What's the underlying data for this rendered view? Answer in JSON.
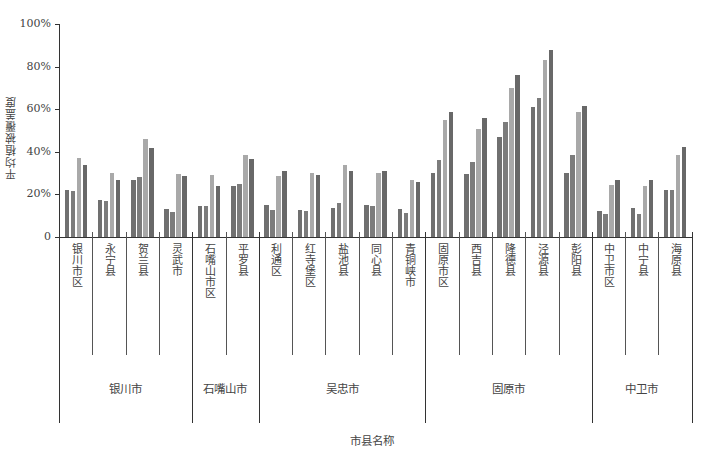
{
  "chart_data": {
    "type": "bar",
    "title": "",
    "xlabel": "市县名称",
    "ylabel": "平均植被覆盖度",
    "ylim": [
      0,
      100
    ],
    "yticks": [
      "0",
      "20%",
      "40%",
      "60%",
      "80%",
      "100%"
    ],
    "grid": false,
    "legend": null,
    "categories": [
      "银川市区",
      "永宁县",
      "贺兰县",
      "灵武市",
      "石嘴山市区",
      "平罗县",
      "利通区",
      "红寺堡区",
      "盐池县",
      "同心县",
      "青铜峡市",
      "固原市区",
      "西吉县",
      "隆德县",
      "泾源县",
      "彭阳县",
      "中卫市区",
      "中宁县",
      "海原县"
    ],
    "groups": [
      {
        "name": "银川市",
        "span": [
          0,
          3
        ]
      },
      {
        "name": "石嘴山市",
        "span": [
          4,
          5
        ]
      },
      {
        "name": "吴忠市",
        "span": [
          6,
          10
        ]
      },
      {
        "name": "固原市",
        "span": [
          11,
          15
        ]
      },
      {
        "name": "中卫市",
        "span": [
          16,
          18
        ]
      }
    ],
    "series": [
      {
        "name": "series-1",
        "color": "#707070",
        "values": [
          22,
          17.5,
          27,
          13,
          14.7,
          24.2,
          15.2,
          12.5,
          13.7,
          15,
          13.3,
          30,
          29.5,
          47,
          61,
          30.2,
          12.3,
          13.6,
          22
        ]
      },
      {
        "name": "series-2",
        "color": "#7c7c7c",
        "values": [
          21.5,
          17,
          28,
          11.6,
          14.6,
          24.7,
          12.5,
          12.2,
          16,
          14.4,
          11.3,
          36,
          35,
          54,
          65.3,
          38.6,
          10.7,
          10.7,
          22.2
        ]
      },
      {
        "name": "series-3",
        "color": "#a9a9a9",
        "values": [
          37,
          30,
          46,
          29.7,
          29,
          38.5,
          28.6,
          30,
          33.8,
          30,
          26.6,
          55,
          50.5,
          70,
          83,
          58.8,
          24.3,
          24.2,
          38.5
        ]
      },
      {
        "name": "series-4",
        "color": "#686868",
        "values": [
          34,
          27,
          42,
          28.6,
          24,
          36.6,
          30.8,
          29,
          30.8,
          30.8,
          26,
          58.6,
          56,
          76,
          88,
          61.5,
          27,
          26.6,
          42.3
        ]
      }
    ]
  }
}
